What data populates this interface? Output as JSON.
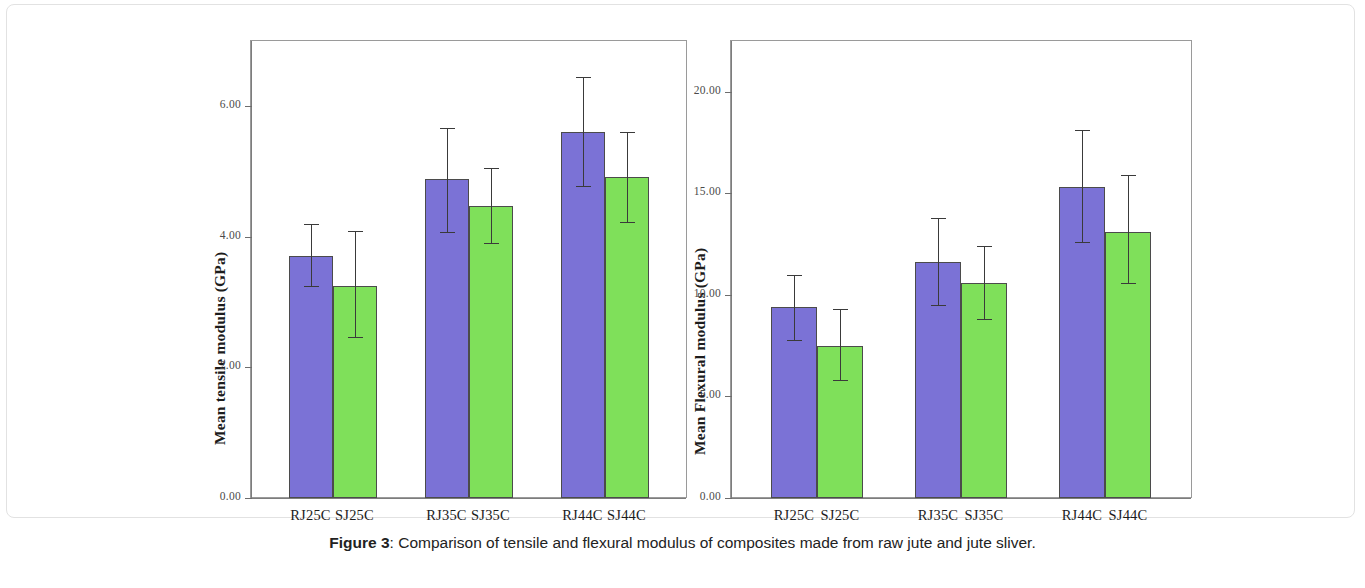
{
  "caption": {
    "label": "Figure 3",
    "separator": ": ",
    "text": "Comparison of tensile and flexural modulus of composites made from raw jute and jute sliver."
  },
  "colors": {
    "series_raw_jute": "#7b72d6",
    "series_jute_sliver": "#7fe05a",
    "axis": "#7d7d7d",
    "error_bar": "#3a3a3a",
    "frame": "#e2e2e2"
  },
  "chart_data": [
    {
      "type": "bar",
      "id": "tensile",
      "title": "",
      "xlabel": "",
      "ylabel": "Mean tensile modulus (GPa)",
      "ylim": [
        0,
        7.0
      ],
      "yticks": [
        0,
        2,
        4,
        6
      ],
      "ytick_labels": [
        "0.00",
        "2.00",
        "4.00",
        "6.00"
      ],
      "grid": false,
      "legend": "none",
      "categories": [
        "RJ25C",
        "SJ25C",
        "RJ35C",
        "SJ35C",
        "RJ44C",
        "SJ44C"
      ],
      "bar_colors": [
        "purple",
        "green",
        "purple",
        "green",
        "purple",
        "green"
      ],
      "values": [
        3.71,
        3.24,
        4.88,
        4.48,
        5.6,
        4.91
      ],
      "err_upper": [
        4.19,
        4.09,
        5.66,
        5.05,
        6.45,
        5.6
      ],
      "err_lower": [
        3.24,
        2.47,
        4.07,
        3.91,
        4.78,
        4.22
      ]
    },
    {
      "type": "bar",
      "id": "flexural",
      "title": "",
      "xlabel": "",
      "ylabel": "Mean Flexural modulus (GPa)",
      "ylim": [
        0,
        22.5
      ],
      "yticks": [
        0,
        5,
        10,
        15,
        20
      ],
      "ytick_labels": [
        "0.00",
        "5.00",
        "10.00",
        "15.00",
        "20.00"
      ],
      "grid": false,
      "legend": "none",
      "categories": [
        "RJ25C",
        "SJ25C",
        "RJ35C",
        "SJ35C",
        "RJ44C",
        "SJ44C"
      ],
      "bar_colors": [
        "purple",
        "green",
        "purple",
        "green",
        "purple",
        "green"
      ],
      "values": [
        9.4,
        7.5,
        11.6,
        10.6,
        15.3,
        13.1
      ],
      "err_upper": [
        11.0,
        9.3,
        13.8,
        12.4,
        18.1,
        15.9
      ],
      "err_lower": [
        7.8,
        5.8,
        9.5,
        8.8,
        12.6,
        10.6
      ]
    }
  ]
}
